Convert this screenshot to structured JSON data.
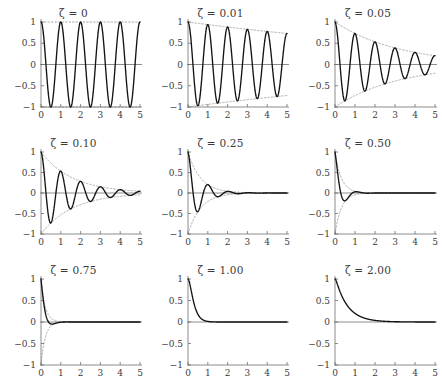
{
  "figure": {
    "kind": "multi-panel-plot-grid",
    "rows": 3,
    "cols": 3,
    "background": "#ffffff",
    "curve_color": "#141414",
    "envelope_color": "#8d8d8d",
    "axis_color": "#6f6f6f",
    "label_color": "#3b3b3b"
  },
  "chart_data": [
    {
      "type": "line",
      "title": "ζ = 0",
      "zeta": 0,
      "xlabel": "",
      "ylabel": "",
      "xlim": [
        0,
        5
      ],
      "ylim": [
        -1,
        1
      ],
      "xticks": [
        0,
        1,
        2,
        3,
        4,
        5
      ],
      "xticklabels": [
        "0",
        "1",
        "2",
        "3",
        "4",
        "5"
      ],
      "yticks": [
        -1,
        -0.5,
        0,
        0.5,
        1
      ],
      "yticklabels": [
        "−1",
        "−0.5",
        "0",
        "0.5",
        "1"
      ],
      "grid": false,
      "legend": "none",
      "series": [
        {
          "name": "response",
          "style": "solid",
          "formula": "exp(-zeta*omega*t)*cos(omega*sqrt(1-zeta^2)*t)",
          "omega": 6.2831853
        },
        {
          "name": "upper-envelope",
          "style": "dotted",
          "formula": "exp(-zeta*omega*t)"
        },
        {
          "name": "lower-envelope",
          "style": "dotted",
          "formula": "-exp(-zeta*omega*t)"
        }
      ]
    },
    {
      "type": "line",
      "title": "ζ = 0.01",
      "zeta": 0.01,
      "xlim": [
        0,
        5
      ],
      "ylim": [
        -1,
        1
      ],
      "xticks": [
        0,
        1,
        2,
        3,
        4,
        5
      ],
      "xticklabels": [
        "0",
        "1",
        "2",
        "3",
        "4",
        "5"
      ],
      "yticks": [
        -1,
        -0.5,
        0,
        0.5,
        1
      ],
      "yticklabels": [
        "−1",
        "−0.5",
        "0",
        "0.5",
        "1"
      ],
      "grid": false,
      "legend": "none"
    },
    {
      "type": "line",
      "title": "ζ = 0.05",
      "zeta": 0.05,
      "xlim": [
        0,
        5
      ],
      "ylim": [
        -1,
        1
      ],
      "xticks": [
        0,
        1,
        2,
        3,
        4,
        5
      ],
      "xticklabels": [
        "0",
        "1",
        "2",
        "3",
        "4",
        "5"
      ],
      "yticks": [
        -1,
        -0.5,
        0,
        0.5,
        1
      ],
      "yticklabels": [
        "−1",
        "−0.5",
        "0",
        "0.5",
        "1"
      ],
      "grid": false,
      "legend": "none"
    },
    {
      "type": "line",
      "title": "ζ = 0.10",
      "zeta": 0.1,
      "xlim": [
        0,
        5
      ],
      "ylim": [
        -1,
        1
      ],
      "xticks": [
        0,
        1,
        2,
        3,
        4,
        5
      ],
      "xticklabels": [
        "0",
        "1",
        "2",
        "3",
        "4",
        "5"
      ],
      "yticks": [
        -1,
        -0.5,
        0,
        0.5,
        1
      ],
      "yticklabels": [
        "−1",
        "−0.5",
        "0",
        "0.5",
        "1"
      ],
      "grid": false,
      "legend": "none"
    },
    {
      "type": "line",
      "title": "ζ = 0.25",
      "zeta": 0.25,
      "xlim": [
        0,
        5
      ],
      "ylim": [
        -1,
        1
      ],
      "xticks": [
        0,
        1,
        2,
        3,
        4,
        5
      ],
      "xticklabels": [
        "0",
        "1",
        "2",
        "3",
        "4",
        "5"
      ],
      "yticks": [
        -1,
        -0.5,
        0,
        0.5,
        1
      ],
      "yticklabels": [
        "−1",
        "−0.5",
        "0",
        "0.5",
        "1"
      ],
      "grid": false,
      "legend": "none"
    },
    {
      "type": "line",
      "title": "ζ = 0.50",
      "zeta": 0.5,
      "xlim": [
        0,
        5
      ],
      "ylim": [
        -1,
        1
      ],
      "xticks": [
        0,
        1,
        2,
        3,
        4,
        5
      ],
      "xticklabels": [
        "0",
        "1",
        "2",
        "3",
        "4",
        "5"
      ],
      "yticks": [
        -1,
        -0.5,
        0,
        0.5,
        1
      ],
      "yticklabels": [
        "−1",
        "−0.5",
        "0",
        "0.5",
        "1"
      ],
      "grid": false,
      "legend": "none"
    },
    {
      "type": "line",
      "title": "ζ = 0.75",
      "zeta": 0.75,
      "xlim": [
        0,
        5
      ],
      "ylim": [
        -1,
        1
      ],
      "xticks": [
        0,
        1,
        2,
        3,
        4,
        5
      ],
      "xticklabels": [
        "0",
        "1",
        "2",
        "3",
        "4",
        "5"
      ],
      "yticks": [
        -1,
        -0.5,
        0,
        0.5,
        1
      ],
      "yticklabels": [
        "−1",
        "−0.5",
        "0",
        "0.5",
        "1"
      ],
      "grid": false,
      "legend": "none"
    },
    {
      "type": "line",
      "title": "ζ = 1.00",
      "zeta": 1.0,
      "xlim": [
        0,
        5
      ],
      "ylim": [
        -1,
        1
      ],
      "xticks": [
        0,
        1,
        2,
        3,
        4,
        5
      ],
      "xticklabels": [
        "0",
        "1",
        "2",
        "3",
        "4",
        "5"
      ],
      "yticks": [
        -1,
        -0.5,
        0,
        0.5,
        1
      ],
      "yticklabels": [
        "−1",
        "−0.5",
        "0",
        "0.5",
        "1"
      ],
      "grid": false,
      "legend": "none"
    },
    {
      "type": "line",
      "title": "ζ = 2.00",
      "zeta": 2.0,
      "xlim": [
        0,
        5
      ],
      "ylim": [
        -1,
        1
      ],
      "xticks": [
        0,
        1,
        2,
        3,
        4,
        5
      ],
      "xticklabels": [
        "0",
        "1",
        "2",
        "3",
        "4",
        "5"
      ],
      "yticks": [
        -1,
        -0.5,
        0,
        0.5,
        1
      ],
      "yticklabels": [
        "−1",
        "−0.5",
        "0",
        "0.5",
        "1"
      ],
      "grid": false,
      "legend": "none"
    }
  ]
}
